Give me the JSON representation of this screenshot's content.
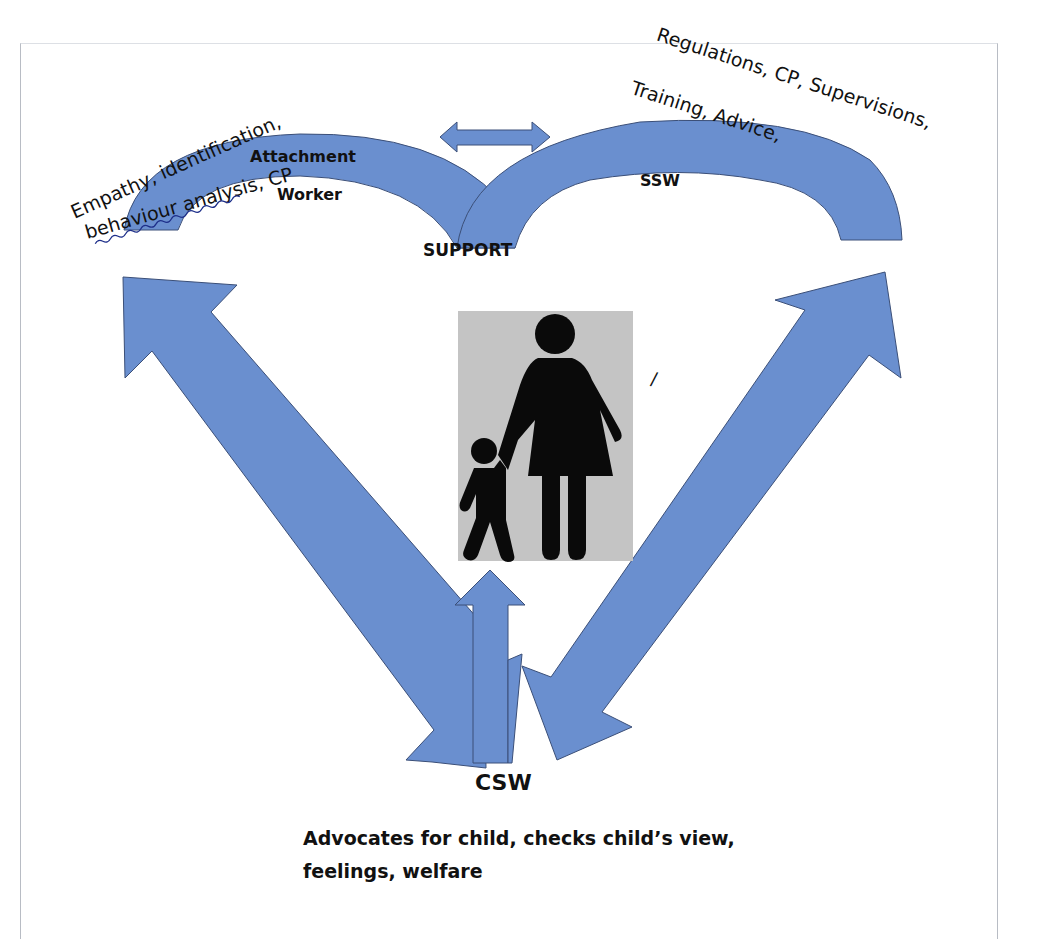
{
  "diagram": {
    "type": "relationship-diagram",
    "colors": {
      "arrow_fill": "#6a8fcf",
      "arrow_stroke": "#3b4f78",
      "figure_background": "#c4c4c4",
      "figure_silhouette": "#0a0a0a",
      "text": "#111111",
      "frame_border": "#b8bcc4"
    },
    "roles": {
      "attachment_worker": {
        "label_line1": "Attachment",
        "label_line2": "Worker",
        "curved_annotation_line1": "Empathy, identification,",
        "curved_annotation_line2": "behaviour  analysis, CP"
      },
      "ssw": {
        "label": "SSW",
        "curved_annotation_line1": "Regulations,  CP, Supervisions,",
        "curved_annotation_line2": "Training, Advice,"
      },
      "csw": {
        "label": "CSW",
        "description": "Advocates for child, checks child’s view, feelings, welfare"
      }
    },
    "center_label": "SUPPORT",
    "center_image": "parent-and-child-icon",
    "stray_mark": "/",
    "connections": [
      {
        "from": "attachment_worker",
        "to": "ssw",
        "type": "double-arrow"
      },
      {
        "from": "attachment_worker",
        "to": "csw",
        "type": "double-arrow"
      },
      {
        "from": "ssw",
        "to": "csw",
        "type": "double-arrow"
      },
      {
        "from": "csw",
        "to": "child",
        "type": "single-arrow-up"
      }
    ]
  }
}
